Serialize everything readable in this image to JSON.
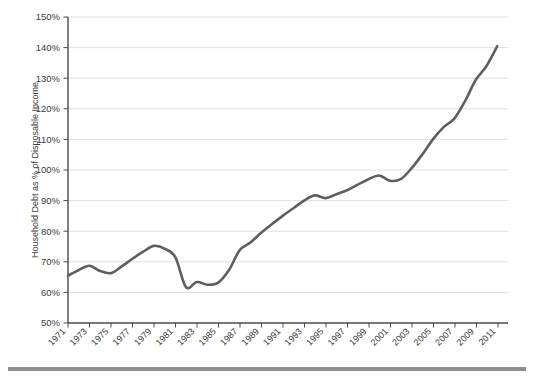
{
  "chart_data": {
    "type": "line",
    "title": "",
    "subtitle": "",
    "xlabel": "",
    "ylabel": "Household Debt as % of Disposable Income",
    "xlim": [
      1971,
      2012
    ],
    "ylim": [
      50,
      150
    ],
    "ytick_labels": [
      "150%",
      "140%",
      "130%",
      "120%",
      "110%",
      "100%",
      "90%",
      "80%",
      "70%",
      "60%",
      "50%"
    ],
    "ytick_values": [
      150,
      140,
      130,
      120,
      110,
      100,
      90,
      80,
      70,
      60,
      50
    ],
    "xtick_labels": [
      "1971",
      "1973",
      "1975",
      "1977",
      "1979",
      "1981",
      "1983",
      "1985",
      "1987",
      "1989",
      "1991",
      "1993",
      "1995",
      "1997",
      "1999",
      "2001",
      "2003",
      "2005",
      "2007",
      "2009",
      "2011"
    ],
    "xtick_values": [
      1971,
      1973,
      1975,
      1977,
      1979,
      1981,
      1983,
      1985,
      1987,
      1989,
      1991,
      1993,
      1995,
      1997,
      1999,
      2001,
      2003,
      2005,
      2007,
      2009,
      2011
    ],
    "grid": "horizontal",
    "legend": "none",
    "series": [
      {
        "name": "Household Debt as % of Disposable Income",
        "color": "#5f5f5f",
        "x": [
          1971,
          1972,
          1973,
          1974,
          1975,
          1976,
          1977,
          1978,
          1979,
          1980,
          1981,
          1982,
          1983,
          1984,
          1985,
          1986,
          1987,
          1988,
          1989,
          1990,
          1991,
          1992,
          1993,
          1994,
          1995,
          1996,
          1997,
          1998,
          1999,
          2000,
          2001,
          2002,
          2003,
          2004,
          2005,
          2006,
          2007,
          2008,
          2009,
          2010,
          2011
        ],
        "values": [
          65.5,
          67.3,
          68.7,
          67.0,
          66.3,
          68.5,
          71.0,
          73.3,
          75.2,
          74.3,
          71.5,
          61.7,
          63.4,
          62.5,
          63.2,
          67.3,
          73.8,
          76.3,
          79.5,
          82.3,
          85.0,
          87.5,
          90.0,
          91.7,
          90.8,
          92.1,
          93.4,
          95.2,
          97.0,
          98.2,
          96.5,
          97.0,
          100.5,
          105.0,
          110.0,
          114.0,
          116.8,
          122.5,
          129.5,
          134.0,
          140.5
        ]
      }
    ]
  },
  "axis": {
    "y_title": "Household Debt as % of Disposable Income"
  },
  "decorations": {
    "footer_rule_color": "#8f8f8f"
  }
}
